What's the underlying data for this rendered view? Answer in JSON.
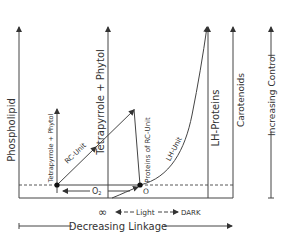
{
  "diagram": {
    "axes": {
      "phospholipid": "Phospholipid",
      "tetrapyrrole_phytol_small": "Tetrapyrrole + Phytol",
      "tetrapyrrole_phytol_large": "Tetrapyrrole + Phytol",
      "proteins_rc_unit": "Proteins of RC-Unit",
      "lh_proteins": "LH-Proteins",
      "carotenoids": "Carotenoids",
      "increasing_control": "Increasing Control"
    },
    "paths": {
      "rc_unit": "RC-Unit",
      "lh_unit": "LH-Unit",
      "o2": "O",
      "o2_sub": "2"
    },
    "points": {
      "origin_label": "O"
    },
    "bottom": {
      "infinity": "∞",
      "light": "Light",
      "dark": "DARK",
      "decreasing_linkage": "Decreasing Linkage"
    },
    "colors": {
      "line": "#333333",
      "text": "#333333",
      "background": "#ffffff"
    }
  }
}
